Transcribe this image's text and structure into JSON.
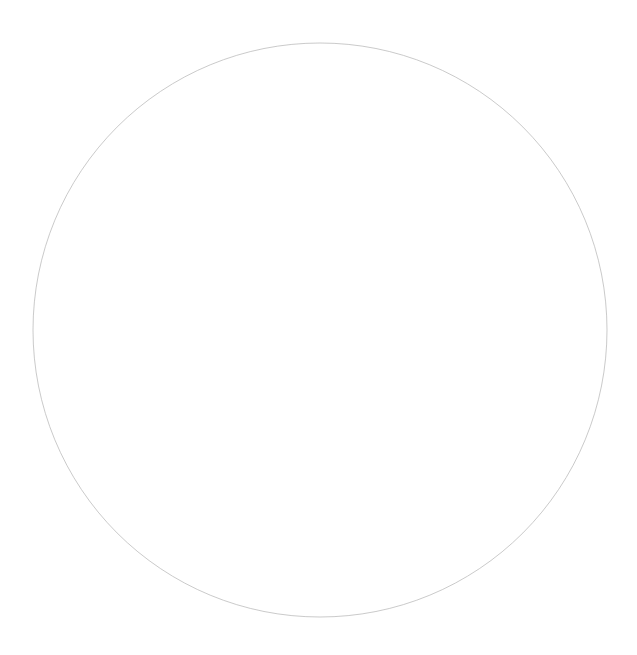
{
  "canvas": {
    "width": 637,
    "height": 655,
    "background": "#ffffff"
  },
  "shape": {
    "type": "circle",
    "cx": 320,
    "cy": 330,
    "r": 287,
    "stroke": "#b8b8b8",
    "stroke_width": 1,
    "stroke_opacity": 0.75,
    "fill": "none"
  }
}
